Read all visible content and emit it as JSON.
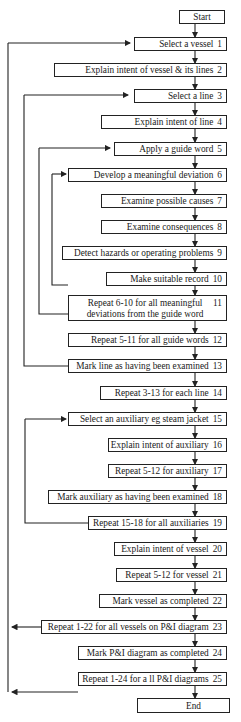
{
  "flowchart": {
    "start": "Start",
    "end": "End",
    "steps": [
      {
        "n": "1",
        "label": "Select a vessel"
      },
      {
        "n": "2",
        "label": "Explain intent of vessel & its lines"
      },
      {
        "n": "3",
        "label": "Select a line"
      },
      {
        "n": "4",
        "label": "Explain intent of line"
      },
      {
        "n": "5",
        "label": "Apply a guide word"
      },
      {
        "n": "6",
        "label": "Develop a meaningful deviation"
      },
      {
        "n": "7",
        "label": "Examine possible causes"
      },
      {
        "n": "8",
        "label": "Examine consequences"
      },
      {
        "n": "9",
        "label": "Detect hazards or operating problems"
      },
      {
        "n": "10",
        "label": "Make suitable record"
      },
      {
        "n": "11",
        "label": "Repeat 6-10 for all meaningful deviations from the guide word"
      },
      {
        "n": "12",
        "label": "Repeat 5-11 for all guide words"
      },
      {
        "n": "13",
        "label": "Mark line as having been examined"
      },
      {
        "n": "14",
        "label": "Repeat 3-13 for each line"
      },
      {
        "n": "15",
        "label": "Select an auxiliary eg steam jacket"
      },
      {
        "n": "16",
        "label": "Explain intent of auxiliary"
      },
      {
        "n": "17",
        "label": "Repeat 5-12 for auxiliary"
      },
      {
        "n": "18",
        "label": "Mark auxiliary as having been examined"
      },
      {
        "n": "19",
        "label": "Repeat 15-18 for all auxiliaries"
      },
      {
        "n": "20",
        "label": "Explain intent of vessel"
      },
      {
        "n": "21",
        "label": "Repeat 5-12 for vessel"
      },
      {
        "n": "22",
        "label": "Mark vessel as completed"
      },
      {
        "n": "23",
        "label": "Repeat 1-22 for all vessels on P&I diagram"
      },
      {
        "n": "24",
        "label": "Mark P&I diagram as completed"
      },
      {
        "n": "25",
        "label": "Repeat 1-24 for a ll P&I diagrams"
      }
    ],
    "colors": {
      "line": "#222222",
      "box_border": "#222222",
      "background": "#ffffff"
    }
  }
}
